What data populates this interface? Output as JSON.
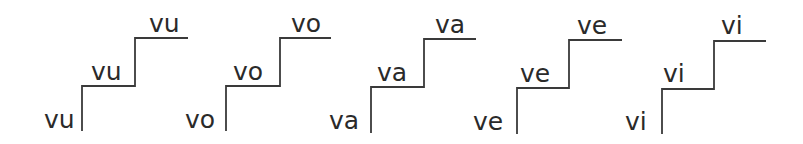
{
  "groups": [
    {
      "syllable": "vu",
      "levels": [
        "vu",
        "vu",
        "vu"
      ]
    },
    {
      "syllable": "vo",
      "levels": [
        "vo",
        "vo",
        "vo"
      ]
    },
    {
      "syllable": "va",
      "levels": [
        "va",
        "va",
        "va"
      ]
    },
    {
      "syllable": "ve",
      "levels": [
        "ve",
        "ve",
        "ve"
      ]
    },
    {
      "syllable": "vi",
      "levels": [
        "vi",
        "vi",
        "vi"
      ]
    }
  ],
  "colors": {
    "line": "#3a3a3a",
    "text": "#2a2a2a",
    "background": "#ffffff"
  }
}
